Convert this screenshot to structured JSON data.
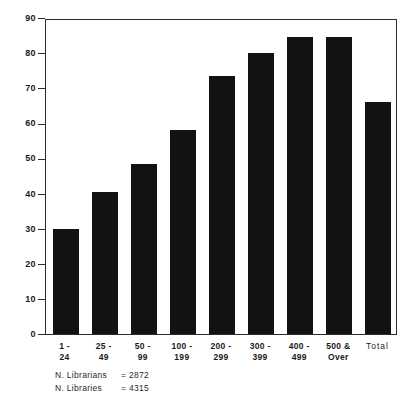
{
  "chart_data": {
    "type": "bar",
    "title": "",
    "xlabel": "",
    "ylabel": "",
    "ylim": [
      0,
      90
    ],
    "ytick_step": 10,
    "grid": false,
    "legend": "none",
    "bar_color": "#121212",
    "categories": [
      "1-24",
      "25-49",
      "50-99",
      "100-199",
      "200-299",
      "300-399",
      "400-499",
      "500 & Over",
      "Total"
    ],
    "category_lines": [
      {
        "l1": "1 -",
        "l2": "24"
      },
      {
        "l1": "25 -",
        "l2": "49"
      },
      {
        "l1": "50 -",
        "l2": "99"
      },
      {
        "l1": "100 -",
        "l2": "199"
      },
      {
        "l1": "200 -",
        "l2": "299"
      },
      {
        "l1": "300 -",
        "l2": "399"
      },
      {
        "l1": "400 -",
        "l2": "499"
      },
      {
        "l1": "500 &",
        "l2": "Over"
      },
      {
        "l1": "Total",
        "l2": ""
      }
    ],
    "values": [
      30,
      40.5,
      48.5,
      58,
      73.5,
      80,
      84.5,
      84.5,
      66
    ],
    "ytick_labels": [
      "0",
      "10",
      "20",
      "30",
      "40",
      "50",
      "60",
      "70",
      "80",
      "90"
    ],
    "ytick_values": [
      0,
      10,
      20,
      30,
      40,
      50,
      60,
      70,
      80,
      90
    ]
  },
  "footnotes": [
    {
      "label": "N. Librarians",
      "sep": "=",
      "value": "2872"
    },
    {
      "label": "N. Libraries",
      "sep": "=",
      "value": "4315"
    }
  ]
}
